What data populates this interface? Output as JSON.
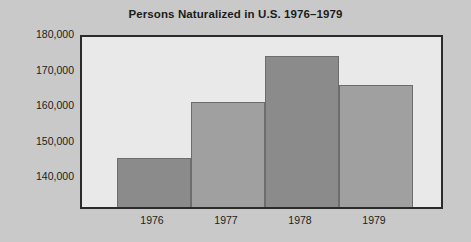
{
  "chart_data": {
    "type": "bar",
    "title": "Persons Naturalized in U.S. 1976–1979",
    "xlabel": "",
    "ylabel": "",
    "categories": [
      "1976",
      "1977",
      "1978",
      "1979"
    ],
    "values": [
      145500,
      161000,
      174000,
      166000
    ],
    "ylim": [
      131000,
      180000
    ],
    "ytick_labels": [
      "140,000",
      "150,000",
      "160,000",
      "170,000",
      "180,000"
    ],
    "ytick_values": [
      140000,
      150000,
      160000,
      170000,
      180000
    ],
    "minor_ytick_values": [
      135000,
      145000,
      155000,
      165000,
      175000
    ],
    "grid": false,
    "legend": "none",
    "bar_shades": [
      "dark",
      "light",
      "dark",
      "light"
    ],
    "colors": {
      "bar_dark": "#8b8b8b",
      "bar_light": "#a0a0a0",
      "bar_edge": "#6d6d6d",
      "plot_background": "#e9e9e9",
      "figure_background": "#c9c9c9",
      "axis": "#2b2b2b",
      "text": "#1c1c1c"
    }
  }
}
